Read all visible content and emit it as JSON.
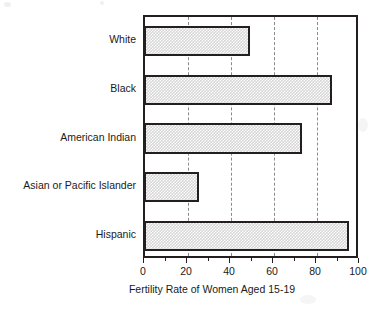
{
  "chart_data": {
    "type": "bar",
    "orientation": "horizontal",
    "title": "",
    "xlabel": "Fertility Rate of Women Aged 15-19",
    "ylabel": "",
    "categories": [
      "White",
      "Black",
      "American Indian",
      "Asian or Pacific Islander",
      "Hispanic"
    ],
    "values": [
      49,
      87,
      73,
      25,
      95
    ],
    "xlim": [
      0,
      100
    ],
    "xticks": [
      0,
      20,
      40,
      60,
      80,
      100
    ],
    "xtick_labels": [
      "0",
      "20",
      "40",
      "60",
      "80",
      "100"
    ],
    "minor_xticks": [
      10,
      30,
      50,
      70,
      90
    ],
    "gridlines": [
      20,
      40,
      60,
      80
    ],
    "grid": true,
    "grid_style": "dashed-vertical",
    "legend": null,
    "bar_fill": "#d7d7d7",
    "bar_pattern": "fine-checkerboard-dither",
    "bar_edge_color": "#231f20",
    "frame_color": "#231f20",
    "grid_color": "#8a8a8a",
    "background": "#ffffff",
    "series": [
      {
        "name": "Fertility Rate of Women Aged 15-19",
        "points": [
          {
            "category": "White",
            "value": 49
          },
          {
            "category": "Black",
            "value": 87
          },
          {
            "category": "American Indian",
            "value": 73
          },
          {
            "category": "Asian or Pacific Islander",
            "value": 25
          },
          {
            "category": "Hispanic",
            "value": 95
          }
        ]
      }
    ]
  }
}
